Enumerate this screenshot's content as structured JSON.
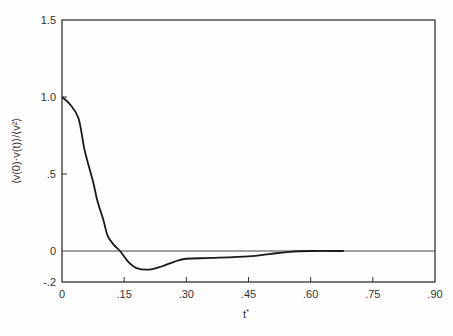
{
  "chart_data": {
    "type": "line",
    "title": "",
    "xlabel": "t*",
    "ylabel": "<v(0)·v(t)>/<v²>",
    "xlim": [
      0,
      0.9
    ],
    "ylim": [
      -0.2,
      1.5
    ],
    "grid": false,
    "legend": null,
    "x_ticks": [
      0,
      0.15,
      0.3,
      0.45,
      0.6,
      0.75,
      0.9
    ],
    "x_tick_labels": [
      "0",
      ".15",
      ".30",
      ".45",
      ".60",
      ".75",
      ".90"
    ],
    "y_ticks": [
      -0.2,
      0,
      0.5,
      1.0,
      1.5
    ],
    "y_tick_labels": [
      "-.2",
      "0",
      ".5",
      "1.0",
      "1.5"
    ],
    "reference_lines": [
      {
        "type": "horizontal",
        "y": 0
      }
    ],
    "series": [
      {
        "name": "velocity autocorrelation",
        "x": [
          0,
          0.02,
          0.04,
          0.055,
          0.075,
          0.085,
          0.1,
          0.11,
          0.125,
          0.14,
          0.16,
          0.18,
          0.21,
          0.24,
          0.27,
          0.3,
          0.36,
          0.45,
          0.5,
          0.55,
          0.6,
          0.68
        ],
        "values": [
          1.0,
          0.95,
          0.86,
          0.65,
          0.45,
          0.33,
          0.2,
          0.1,
          0.04,
          0.0,
          -0.07,
          -0.11,
          -0.12,
          -0.1,
          -0.07,
          -0.05,
          -0.045,
          -0.035,
          -0.02,
          -0.005,
          0.0,
          0.0
        ]
      }
    ]
  },
  "axes": {
    "xlabel_text": "t",
    "xlabel_sup": "*",
    "ylabel_text": "⟨v(0)·v(t)⟩/⟨v²⟩"
  }
}
